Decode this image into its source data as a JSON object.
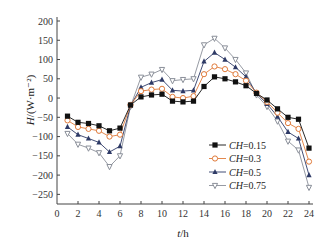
{
  "chart_data": {
    "type": "line",
    "title": "",
    "xlabel": "t/h",
    "ylabel": "H/(W·m⁻²)",
    "xlim": [
      0,
      24
    ],
    "ylim": [
      -250,
      200
    ],
    "xticks": [
      0,
      2,
      4,
      6,
      8,
      10,
      12,
      14,
      16,
      18,
      20,
      22,
      24
    ],
    "yticks": [
      200,
      150,
      100,
      50,
      0,
      -50,
      -100,
      -150,
      -200,
      -250
    ],
    "grid": false,
    "legend_position": "lower right (inside)",
    "x": [
      1,
      2,
      3,
      4,
      5,
      6,
      7,
      8,
      9,
      10,
      11,
      12,
      13,
      14,
      15,
      16,
      17,
      18,
      19,
      20,
      21,
      22,
      23,
      24
    ],
    "series": [
      {
        "name": "CH=0.15",
        "marker": "filled-square",
        "color": "#111111",
        "values": [
          -47,
          -63,
          -66,
          -72,
          -85,
          -78,
          -18,
          3,
          8,
          10,
          -8,
          -10,
          -8,
          30,
          55,
          50,
          42,
          32,
          12,
          -5,
          -28,
          -50,
          -55,
          -130
        ]
      },
      {
        "name": "CH=0.3",
        "marker": "open-circle",
        "color": "#e07a3a",
        "values": [
          -58,
          -75,
          -80,
          -85,
          -100,
          -95,
          -18,
          18,
          22,
          24,
          3,
          0,
          5,
          62,
          82,
          75,
          62,
          45,
          14,
          -10,
          -38,
          -65,
          -80,
          -165
        ]
      },
      {
        "name": "CH=0.5",
        "marker": "filled-triangle-up",
        "color": "#2e3a66",
        "values": [
          -75,
          -95,
          -105,
          -115,
          -140,
          -125,
          -20,
          28,
          40,
          48,
          20,
          18,
          20,
          95,
          118,
          100,
          80,
          55,
          12,
          -15,
          -48,
          -88,
          -105,
          -200
        ]
      },
      {
        "name": "CH=0.75",
        "marker": "open-triangle-down",
        "color": "#8a8f99",
        "values": [
          -92,
          -120,
          -130,
          -142,
          -178,
          -150,
          -22,
          54,
          62,
          74,
          45,
          48,
          50,
          138,
          155,
          130,
          100,
          65,
          8,
          -22,
          -60,
          -112,
          -135,
          -232
        ]
      }
    ]
  },
  "axes": {
    "x_label_italic": "t",
    "x_label_unit": "/h",
    "y_label_italic": "H",
    "y_label_unit": "/(W·m⁻²)"
  },
  "legend": [
    {
      "prefix": "CH",
      "value": "=0.15"
    },
    {
      "prefix": "CH",
      "value": "=0.3"
    },
    {
      "prefix": "CH",
      "value": "=0.5"
    },
    {
      "prefix": "CH",
      "value": "=0.75"
    }
  ]
}
